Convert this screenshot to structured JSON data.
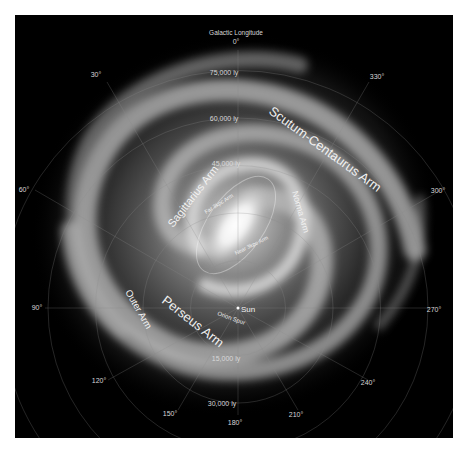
{
  "figure": {
    "title": "Galactic Longitude",
    "background_color": "#000000",
    "frame_color": "#ffffff"
  },
  "longitude_labels": [
    {
      "label": "0°",
      "x": 236,
      "y": 44
    },
    {
      "label": "30°",
      "x": 96,
      "y": 77
    },
    {
      "label": "330°",
      "x": 377,
      "y": 79
    },
    {
      "label": "60°",
      "x": 24,
      "y": 192
    },
    {
      "label": "300°",
      "x": 438,
      "y": 193
    },
    {
      "label": "90°",
      "x": 37,
      "y": 310
    },
    {
      "label": "270°",
      "x": 434,
      "y": 312
    },
    {
      "label": "120°",
      "x": 99,
      "y": 383
    },
    {
      "label": "240°",
      "x": 368,
      "y": 385
    },
    {
      "label": "150°",
      "x": 170,
      "y": 416
    },
    {
      "label": "210°",
      "x": 296,
      "y": 417
    },
    {
      "label": "180°",
      "x": 235,
      "y": 423
    }
  ],
  "distance_labels": [
    {
      "label": "75,000 ly",
      "x": 224,
      "y": 75
    },
    {
      "label": "60,000 ly",
      "x": 224,
      "y": 121
    },
    {
      "label": "45,000 ly",
      "x": 226,
      "y": 166
    },
    {
      "label": "15,000 ly",
      "x": 226,
      "y": 361
    },
    {
      "label": "30,000 ly",
      "x": 222,
      "y": 406
    }
  ],
  "arm_labels": [
    {
      "label": "Scutum-Centaurus Arm",
      "size": 13
    },
    {
      "label": "Norma Arm",
      "size": 9
    },
    {
      "label": "Sagittarius Arm",
      "size": 11
    },
    {
      "label": "Far 3kpc Arm",
      "size": 6
    },
    {
      "label": "Near 3kpc Arm",
      "size": 6
    },
    {
      "label": "Perseus Arm",
      "size": 13
    },
    {
      "label": "Outer Arm",
      "size": 10
    },
    {
      "label": "Orion Spur",
      "size": 6
    },
    {
      "label": "Sun",
      "size": 8
    }
  ],
  "grid": {
    "center": {
      "x": 238,
      "y": 308
    },
    "ring_spacing_px": 47.5,
    "ring_labels_ly": [
      15000,
      30000,
      45000,
      60000,
      75000
    ],
    "spoke_step_deg": 30
  }
}
